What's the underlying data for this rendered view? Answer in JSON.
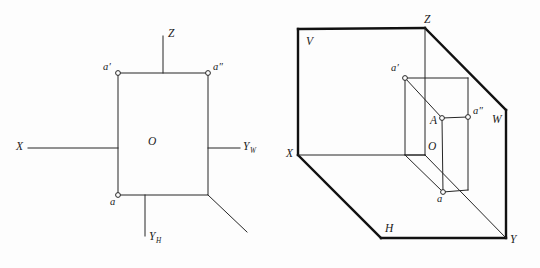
{
  "figure": {
    "background_color": "#fdfdfd",
    "line_color": "#262626",
    "thick_line_color": "#111111",
    "marker_fill": "#ffffff"
  },
  "left_diagram": {
    "name": "unfolded-projection-planes",
    "labels": {
      "z_axis": "Z",
      "x_axis": "X",
      "y_w_axis": "Y",
      "y_w_sub": "W",
      "y_h_axis": "Y",
      "y_h_sub": "H",
      "origin": "O",
      "front_view": "a′",
      "side_view": "a″",
      "top_view": "a"
    },
    "geometry": {
      "rect": {
        "x": 118,
        "y": 73,
        "w": 90,
        "h": 122
      },
      "origin_point": {
        "x": 145,
        "y": 148
      },
      "z_axis_top": {
        "x": 163,
        "y": 36
      },
      "x_axis_left": {
        "x": 28,
        "y": 148
      },
      "y_w_right": {
        "x": 240,
        "y": 148
      },
      "y_h_bottom": {
        "x": 145,
        "y": 236
      },
      "y_45_end": {
        "x": 247,
        "y": 232
      },
      "marker_a_prime": {
        "x": 118,
        "y": 73
      },
      "marker_a_double": {
        "x": 208,
        "y": 73
      },
      "marker_a": {
        "x": 118,
        "y": 195
      }
    }
  },
  "right_diagram": {
    "name": "three-plane-3d-projection-box",
    "labels": {
      "v_plane": "V",
      "h_plane": "H",
      "w_plane": "W",
      "z_axis": "Z",
      "x_axis": "X",
      "y_axis": "Y",
      "origin": "O",
      "point": "A",
      "front_view": "a′",
      "side_view": "a″",
      "top_view": "a"
    },
    "geometry": {
      "v_top_left": {
        "x": 298,
        "y": 29
      },
      "z_corner": {
        "x": 425,
        "y": 28
      },
      "w_corner": {
        "x": 506,
        "y": 110
      },
      "y_corner": {
        "x": 506,
        "y": 238
      },
      "h_bottom_left": {
        "x": 381,
        "y": 238
      },
      "x_corner": {
        "x": 298,
        "y": 155
      },
      "origin_point": {
        "x": 425,
        "y": 155
      },
      "point_A": {
        "x": 442,
        "y": 118
      },
      "marker_a_prime": {
        "x": 405,
        "y": 78
      },
      "marker_a_double": {
        "x": 468,
        "y": 117
      },
      "marker_a": {
        "x": 443,
        "y": 192
      }
    }
  }
}
